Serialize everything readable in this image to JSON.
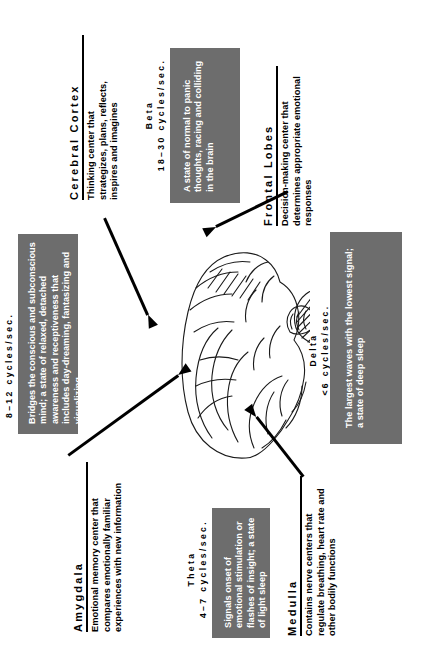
{
  "figure": {
    "orientation": "rotated-90-ccw",
    "colors": {
      "box_fill": "#6d6d6d",
      "box_text": "#ffffff",
      "ink": "#000000",
      "background": "#ffffff"
    }
  },
  "anatomy_labels": [
    {
      "id": "cerebral-cortex",
      "heading": "Cerebral Cortex",
      "body": "Thinking center that strategizes, plans, reflects, inspires and imagines"
    },
    {
      "id": "frontal-lobes",
      "heading": "Frontal Lobes",
      "body": "Decision-making center that determines appropriate emotional responses"
    },
    {
      "id": "amygdala",
      "heading": "Amygdala",
      "body": "Emotional memory center that compares emotionally familiar experiences with new information"
    },
    {
      "id": "medulla",
      "heading": "Medulla",
      "body": "Contains nerve centers that regulate breathing, heart rate and other bodily functions"
    }
  ],
  "brainwaves": [
    {
      "id": "beta",
      "name": "Beta",
      "frequency": "18–30 cycles/sec.",
      "description": "A state of normal to panic thoughts, racing and colliding in the brain"
    },
    {
      "id": "alpha",
      "name": "",
      "frequency": "8–12 cycles/sec.",
      "description": "Bridges the conscious and subconscious mind; a state of relaxed, detached awareness and receptiveness that includes day-dreaming, fantasizing and visualizing"
    },
    {
      "id": "delta",
      "name": "Delta",
      "frequency": "<6 cycles/sec.",
      "description": "The largest waves with the lowest signal; a state of deep sleep"
    },
    {
      "id": "theta",
      "name": "Theta",
      "frequency": "4–7 cycles/sec.",
      "description": "Signals onset of emotional stimulation or flashes of insight; a state of light sleep"
    }
  ],
  "illustration": {
    "name": "brain-lateral-view-line-drawing"
  }
}
